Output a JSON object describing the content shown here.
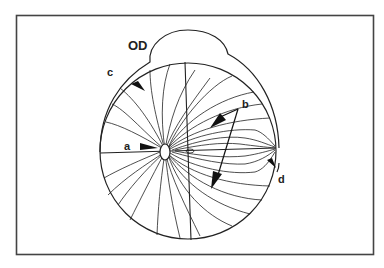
{
  "figure": {
    "eye_label": "OD",
    "labels": {
      "a": "a",
      "b": "b",
      "c": "c",
      "d": "d"
    },
    "colors": {
      "stroke": "#222222",
      "frame": "#444444",
      "background": "#ffffff"
    }
  }
}
